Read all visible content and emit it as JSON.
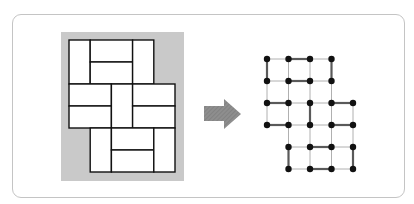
{
  "figure": {
    "colors": {
      "card_border": "#c4c4c4",
      "tiling_background": "#c9c9c9",
      "tile_fill": "#ffffff",
      "tile_stroke": "#111111",
      "arrow": "#8a8a8a",
      "node": "#111111",
      "thin_edge": "#b0b0b0",
      "matched_edge": "#5a5a5a"
    },
    "grid": {
      "columns": 5,
      "rows": 6,
      "row_spans": [
        {
          "row": 0,
          "from_col": 0,
          "to_col": 3
        },
        {
          "row": 1,
          "from_col": 0,
          "to_col": 3
        },
        {
          "row": 2,
          "from_col": 0,
          "to_col": 4
        },
        {
          "row": 3,
          "from_col": 0,
          "to_col": 4
        },
        {
          "row": 4,
          "from_col": 1,
          "to_col": 4
        },
        {
          "row": 5,
          "from_col": 1,
          "to_col": 4
        }
      ]
    },
    "dominoes": [
      {
        "c1": 0,
        "r1": 0,
        "c2": 0,
        "r2": 1
      },
      {
        "c1": 1,
        "r1": 0,
        "c2": 2,
        "r2": 0
      },
      {
        "c1": 1,
        "r1": 1,
        "c2": 2,
        "r2": 1
      },
      {
        "c1": 3,
        "r1": 0,
        "c2": 3,
        "r2": 1
      },
      {
        "c1": 0,
        "r1": 2,
        "c2": 1,
        "r2": 2
      },
      {
        "c1": 0,
        "r1": 3,
        "c2": 1,
        "r2": 3
      },
      {
        "c1": 2,
        "r1": 2,
        "c2": 2,
        "r2": 3
      },
      {
        "c1": 3,
        "r1": 2,
        "c2": 4,
        "r2": 2
      },
      {
        "c1": 3,
        "r1": 3,
        "c2": 4,
        "r2": 3
      },
      {
        "c1": 1,
        "r1": 4,
        "c2": 1,
        "r2": 5
      },
      {
        "c1": 2,
        "r1": 4,
        "c2": 3,
        "r2": 4
      },
      {
        "c1": 2,
        "r1": 5,
        "c2": 3,
        "r2": 5
      },
      {
        "c1": 4,
        "r1": 4,
        "c2": 4,
        "r2": 5
      }
    ],
    "tiling_geometry": {
      "x0": 69,
      "y0": 40,
      "cell_w": 21.2,
      "cell_h": 22
    },
    "graph_geometry": {
      "x0": 267,
      "y0": 59,
      "dx": 21.5,
      "dy": 22,
      "node_radius": 3.2
    },
    "arrow_icon": "right-arrow-icon"
  }
}
